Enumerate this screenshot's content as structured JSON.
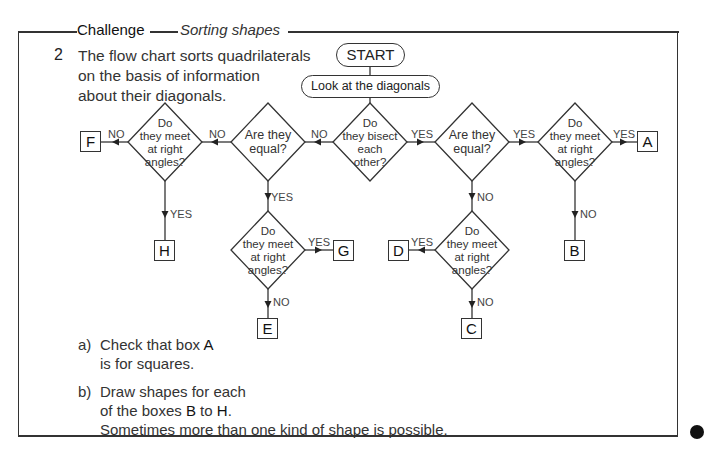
{
  "header": {
    "section_label": "Challenge",
    "title": "Sorting shapes"
  },
  "question": {
    "number": "2",
    "intro_lines": [
      "The flow chart sorts quadrilaterals",
      "on the basis of information",
      "about their diagonals."
    ]
  },
  "flowchart": {
    "start": "START",
    "step": "Look at the diagonals",
    "decisions": {
      "bisect": [
        "Do",
        "they bisect",
        "each",
        "other?"
      ],
      "equal_left": [
        "Are they",
        "equal?"
      ],
      "equal_right": [
        "Are they",
        "equal?"
      ],
      "right_angles_far_left": [
        "Do",
        "they meet",
        "at right",
        "angles?"
      ],
      "right_angles_far_right": [
        "Do",
        "they meet",
        "at right",
        "angles?"
      ],
      "right_angles_lower_left": [
        "Do",
        "they meet",
        "at right",
        "angles?"
      ],
      "right_angles_lower_right": [
        "Do",
        "they meet",
        "at right",
        "angles?"
      ]
    },
    "edge_labels": {
      "bisect_no": "NO",
      "bisect_yes": "YES",
      "equal_left_no": "NO",
      "equal_left_yes": "YES",
      "far_left_no": "NO",
      "far_left_yes": "YES",
      "equal_right_yes": "YES",
      "equal_right_no": "NO",
      "far_right_yes": "YES",
      "far_right_no": "NO",
      "lower_left_yes": "YES",
      "lower_left_no": "NO",
      "lower_right_yes": "YES",
      "lower_right_no": "NO"
    },
    "outcomes": {
      "A": "A",
      "B": "B",
      "C": "C",
      "D": "D",
      "E": "E",
      "F": "F",
      "G": "G",
      "H": "H"
    }
  },
  "tasks": {
    "a": {
      "letter": "a)",
      "line1_prefix": "Check that box ",
      "line1_bold": "A",
      "line2": "is for squares."
    },
    "b": {
      "letter": "b)",
      "line1": "Draw shapes for each",
      "line2_prefix": "of the boxes ",
      "line2_bold1": "B",
      "line2_mid": " to ",
      "line2_bold2": "H",
      "line2_suffix": ".",
      "line3": "Sometimes more than one kind of shape is possible."
    }
  },
  "colors": {
    "ink": "#333333",
    "paper": "#ffffff"
  }
}
